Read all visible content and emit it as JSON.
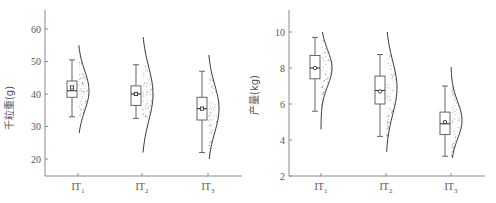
{
  "chart_data": [
    {
      "type": "box",
      "title": "",
      "xlabel": "",
      "ylabel": "千粒重(g)",
      "ylim": [
        15,
        66
      ],
      "yticks": [
        20,
        30,
        40,
        50,
        60
      ],
      "categories": [
        "IT1",
        "IT2",
        "IT3"
      ],
      "category_labels": [
        {
          "base": "IT",
          "sub": "1"
        },
        {
          "base": "IT",
          "sub": "2"
        },
        {
          "base": "IT",
          "sub": "3"
        }
      ],
      "series": [
        {
          "name": "IT1",
          "whisker_low": 33,
          "q1": 39,
          "median": 41,
          "q3": 44,
          "whisker_high": 50.5,
          "mean": 42,
          "density_range": [
            28,
            55
          ],
          "density_peak": 41
        },
        {
          "name": "IT2",
          "whisker_low": 32.5,
          "q1": 36.5,
          "median": 40,
          "q3": 42.5,
          "whisker_high": 49,
          "mean": 40,
          "density_range": [
            22,
            57.5
          ],
          "density_peak": 40
        },
        {
          "name": "IT3",
          "whisker_low": 22,
          "q1": 32,
          "median": 35.5,
          "q3": 39,
          "whisker_high": 47,
          "mean": 35.5,
          "density_range": [
            20,
            52
          ],
          "density_peak": 35.5
        }
      ]
    },
    {
      "type": "box",
      "title": "",
      "xlabel": "",
      "ylabel": "产量(kg)",
      "ylim": [
        2,
        11.1
      ],
      "yticks": [
        2,
        4,
        6,
        8,
        10
      ],
      "categories": [
        "IT1",
        "IT2",
        "IT3"
      ],
      "category_labels": [
        {
          "base": "IT",
          "sub": "1"
        },
        {
          "base": "IT",
          "sub": "2"
        },
        {
          "base": "IT",
          "sub": "3"
        }
      ],
      "series": [
        {
          "name": "IT1",
          "whisker_low": 5.6,
          "q1": 7.4,
          "median": 8.0,
          "q3": 8.7,
          "whisker_high": 9.7,
          "mean": 8.0,
          "density_range": [
            4.6,
            10
          ],
          "density_peak": 8.0
        },
        {
          "name": "IT2",
          "whisker_low": 4.2,
          "q1": 6.0,
          "median": 6.75,
          "q3": 7.55,
          "whisker_high": 8.75,
          "mean": 6.7,
          "density_range": [
            3.35,
            10
          ],
          "density_peak": 6.9
        },
        {
          "name": "IT3",
          "whisker_low": 3.1,
          "q1": 4.3,
          "median": 4.9,
          "q3": 5.55,
          "whisker_high": 7.0,
          "mean": 5.0,
          "density_range": [
            3.0,
            8.05
          ],
          "density_peak": 5.1
        }
      ]
    }
  ]
}
